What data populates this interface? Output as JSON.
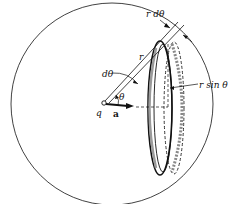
{
  "diagram": {
    "type": "physics-geometry",
    "labels": {
      "r_dtheta": "r dθ",
      "r": "r",
      "dtheta": "dθ",
      "theta": "θ",
      "r_sin_theta": "r sin θ",
      "charge": "q",
      "accel": "a"
    },
    "colors": {
      "stroke": "#111111",
      "ring_fill": "#9a9a9a",
      "background": "#ffffff"
    }
  }
}
